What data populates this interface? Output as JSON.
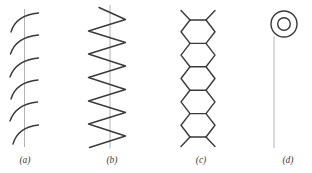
{
  "figure": {
    "background": "#ffffff",
    "stroke_dark": "#3a3a3a",
    "stroke_light": "#a9a9a9",
    "label_font_size": 9.5,
    "panels": [
      {
        "id": "a",
        "label": "(a)",
        "name": "coiled-helix-chain",
        "label_x": 25,
        "label_y": 154,
        "axis_line": {
          "x": 24.5,
          "y1": 9,
          "y2": 147
        },
        "arcs": [
          {
            "x0": 11,
            "y0": 32,
            "cx": 16,
            "cy": 15,
            "x1": 38.5,
            "y1": 13
          },
          {
            "x0": 10.5,
            "y0": 54,
            "cx": 16,
            "cy": 37,
            "x1": 38.5,
            "y1": 35
          },
          {
            "x0": 10,
            "y0": 77,
            "cx": 16,
            "cy": 60,
            "x1": 38.5,
            "y1": 58
          },
          {
            "x0": 11,
            "y0": 99,
            "cx": 16,
            "cy": 82,
            "x1": 38,
            "y1": 80
          },
          {
            "x0": 10,
            "y0": 121,
            "cx": 16,
            "cy": 104,
            "x1": 37.5,
            "y1": 102
          },
          {
            "x0": 13,
            "y0": 144,
            "cx": 18,
            "cy": 127,
            "x1": 38.5,
            "y1": 125
          }
        ]
      },
      {
        "id": "b",
        "label": "(b)",
        "name": "planar-zigzag-chain",
        "label_x": 112,
        "label_y": 154,
        "axis_line": {
          "x": 110,
          "y1": 5,
          "y2": 148.5
        },
        "zigzag_points": [
          [
            99,
            7.5
          ],
          [
            125.5,
            19.5
          ],
          [
            88.5,
            31
          ],
          [
            125.5,
            42.5
          ],
          [
            88.5,
            54
          ],
          [
            125.5,
            66
          ],
          [
            88.5,
            77.5
          ],
          [
            125.5,
            89.5
          ],
          [
            88.5,
            101
          ],
          [
            125.5,
            112.5
          ],
          [
            88.5,
            124
          ],
          [
            125.5,
            136
          ],
          [
            89.5,
            147.5
          ]
        ]
      },
      {
        "id": "c",
        "label": "(c)",
        "name": "fused-hexagon-ring-chain",
        "label_x": 201,
        "label_y": 154,
        "hex_chain": {
          "narrow_left": 190,
          "narrow_right": 206,
          "wide_left": 181,
          "wide_right": 215,
          "top": 20,
          "pitch": 23.4,
          "count": 5,
          "stub_dx": 9,
          "stub_dy": 9.5
        }
      },
      {
        "id": "d",
        "label": "(d)",
        "name": "pendant-ring-chain",
        "label_x": 288,
        "label_y": 154,
        "axis_line": {
          "x": 274,
          "y1": 36.5,
          "y2": 148
        },
        "circles": {
          "cx": 284,
          "cy": 24,
          "outer_r": 13,
          "inner_r": 6.3
        }
      }
    ]
  }
}
